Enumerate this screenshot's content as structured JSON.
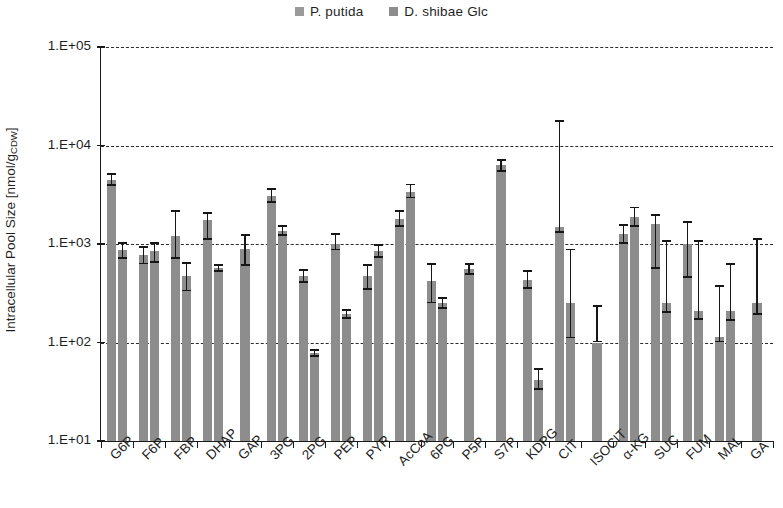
{
  "legend": {
    "entries": [
      {
        "label": "P. putida",
        "color": "#9a9a9a"
      },
      {
        "label": "D. shibae Glc",
        "color": "#8d8d8d"
      }
    ]
  },
  "axes": {
    "y_title_main": "Intracellular Pool Size [nmol/g",
    "y_title_sub": "CDW",
    "y_title_end": "]",
    "y_ticks": [
      "1.E+05",
      "1.E+04",
      "1.E+03",
      "1.E+02",
      "1.E+01"
    ]
  },
  "chart_data": {
    "type": "bar",
    "title": "",
    "xlabel": "",
    "ylabel": "Intracellular Pool Size [nmol/gCDW]",
    "yscale": "log",
    "ylim": [
      10,
      100000
    ],
    "ytick_values": [
      100000,
      10000,
      1000,
      100,
      10
    ],
    "grid": "horizontal dashed",
    "legend_position": "top-center",
    "categories": [
      "G6P",
      "F6P",
      "FBP",
      "DHAP",
      "GAP",
      "3PG",
      "2PG",
      "PEP",
      "PYR",
      "AcCoA",
      "6PG",
      "P5P",
      "S7P",
      "KDPG",
      "CIT",
      "ISOCIT",
      "α-KG",
      "SUC",
      "FUM",
      "MAL",
      "GA"
    ],
    "series": [
      {
        "name": "P. putida",
        "values": [
          4500,
          780,
          1200,
          1750,
          900,
          3100,
          470,
          1000,
          470,
          1800,
          420,
          560,
          6300,
          430,
          1500,
          100,
          1250,
          1600,
          1000,
          115,
          250
        ],
        "err_low": [
          3900,
          620,
          700,
          1100,
          600,
          2600,
          400,
          860,
          340,
          1500,
          250,
          490,
          5400,
          350,
          1300,
          100,
          1000,
          560,
          450,
          100,
          190
        ],
        "err_high": [
          5200,
          960,
          2200,
          2100,
          1250,
          3700,
          560,
          1300,
          620,
          2200,
          640,
          640,
          7300,
          540,
          18000,
          240,
          1600,
          2000,
          1700,
          380,
          1150
        ]
      },
      {
        "name": "D. shibae Glc",
        "values": [
          870,
          850,
          470,
          570,
          null,
          1350,
          78,
          195,
          850,
          3400,
          250,
          null,
          null,
          42,
          250,
          null,
          1900,
          250,
          210,
          210,
          null
        ],
        "err_low": [
          700,
          640,
          330,
          520,
          null,
          1200,
          72,
          175,
          720,
          2900,
          220,
          null,
          null,
          33,
          110,
          null,
          1500,
          200,
          170,
          165,
          null
        ],
        "err_high": [
          1050,
          1050,
          650,
          630,
          null,
          1550,
          86,
          220,
          1000,
          4100,
          290,
          null,
          null,
          55,
          900,
          null,
          2400,
          1100,
          1100,
          640,
          null
        ]
      }
    ]
  }
}
